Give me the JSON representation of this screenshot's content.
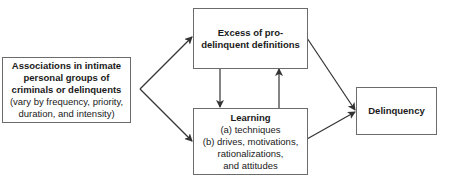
{
  "diagram": {
    "nodes": {
      "associations": {
        "title_lines": [
          "Associations in intimate",
          "personal groups of",
          "criminals or delinquents"
        ],
        "detail_lines": [
          "(vary by frequency, priority,",
          "duration, and intensity)"
        ]
      },
      "definitions": {
        "title_lines": [
          "Excess of pro-",
          "delinquent definitions"
        ]
      },
      "learning": {
        "title_lines": [
          "Learning"
        ],
        "detail_lines": [
          "(a) techniques",
          "(b) drives, motivations,",
          "rationalizations,",
          "and attitudes"
        ]
      },
      "delinquency": {
        "title_lines": [
          "Delinquency"
        ]
      }
    },
    "edges": [
      {
        "from": "associations",
        "to": "definitions"
      },
      {
        "from": "associations",
        "to": "learning"
      },
      {
        "from": "definitions",
        "to": "learning"
      },
      {
        "from": "learning",
        "to": "definitions"
      },
      {
        "from": "definitions",
        "to": "delinquency"
      },
      {
        "from": "learning",
        "to": "delinquency"
      }
    ],
    "colors": {
      "border": "#6b6b6b",
      "arrow": "#333333",
      "text": "#1a1a1a"
    }
  }
}
